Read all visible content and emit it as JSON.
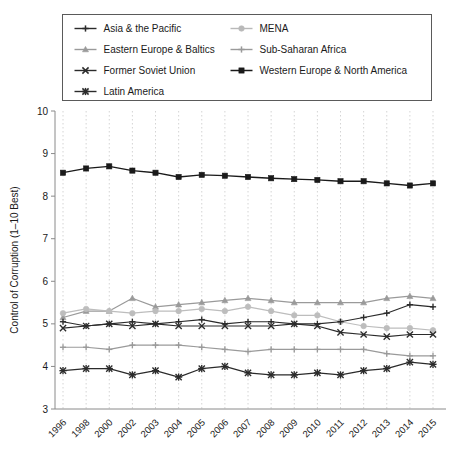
{
  "axis": {
    "ylabel": "Control of Corruption (1–10 Best)",
    "yticks": [
      "3",
      "4",
      "5",
      "6",
      "7",
      "8",
      "9",
      "10"
    ],
    "xlabel": ""
  },
  "legend": {
    "position": "top",
    "entries": [
      {
        "label": "Asia & the Pacific",
        "marker": "plus",
        "color": "#2b2b2b"
      },
      {
        "label": "MENA",
        "marker": "circle",
        "color": "#b9b9b9"
      },
      {
        "label": "Eastern Europe & Baltics",
        "marker": "triangle",
        "color": "#9a9a9a"
      },
      {
        "label": "Sub-Saharan Africa",
        "marker": "plus",
        "color": "#9a9a9a"
      },
      {
        "label": "Former Soviet Union",
        "marker": "x",
        "color": "#2b2b2b"
      },
      {
        "label": "Western Europe & North America",
        "marker": "square",
        "color": "#1a1a1a"
      },
      {
        "label": "Latin America",
        "marker": "star",
        "color": "#2b2b2b"
      }
    ]
  },
  "chart_data": {
    "type": "line",
    "title": "",
    "xlabel": "",
    "ylabel": "Control of Corruption (1–10 Best)",
    "ylim": [
      3,
      10
    ],
    "grid": true,
    "legend_position": "top",
    "categories": [
      "1996",
      "1998",
      "2000",
      "2002",
      "2003",
      "2004",
      "2005",
      "2006",
      "2007",
      "2008",
      "2009",
      "2010",
      "2011",
      "2012",
      "2013",
      "2014",
      "2015"
    ],
    "series": [
      {
        "name": "Western Europe & North America",
        "marker": "square",
        "color": "#1a1a1a",
        "values": [
          8.55,
          8.65,
          8.7,
          8.6,
          8.55,
          8.45,
          8.5,
          8.48,
          8.45,
          8.42,
          8.4,
          8.38,
          8.35,
          8.35,
          8.3,
          8.25,
          8.3
        ]
      },
      {
        "name": "Eastern Europe & Baltics",
        "marker": "triangle",
        "color": "#9a9a9a",
        "values": [
          5.15,
          5.3,
          5.3,
          5.6,
          5.4,
          5.45,
          5.5,
          5.55,
          5.6,
          5.55,
          5.5,
          5.5,
          5.5,
          5.5,
          5.6,
          5.65,
          5.6
        ]
      },
      {
        "name": "MENA",
        "marker": "circle",
        "color": "#bdbdbd",
        "values": [
          5.25,
          5.35,
          5.3,
          5.25,
          5.3,
          5.3,
          5.35,
          5.3,
          5.4,
          5.3,
          5.2,
          5.2,
          5.05,
          4.95,
          4.9,
          4.9,
          4.85
        ]
      },
      {
        "name": "Asia & the Pacific",
        "marker": "plus",
        "color": "#2b2b2b",
        "values": [
          5.05,
          4.95,
          5.0,
          5.05,
          5.0,
          5.05,
          5.1,
          5.0,
          5.05,
          5.05,
          5.0,
          5.0,
          5.05,
          5.15,
          5.25,
          5.45,
          5.4
        ]
      },
      {
        "name": "Former Soviet Union",
        "marker": "x",
        "color": "#2b2b2b",
        "values": [
          4.9,
          4.95,
          5.0,
          4.95,
          5.0,
          4.95,
          4.95,
          4.95,
          4.95,
          4.95,
          5.0,
          4.95,
          4.8,
          4.75,
          4.7,
          4.75,
          4.75
        ]
      },
      {
        "name": "Sub-Saharan Africa",
        "marker": "plus",
        "color": "#9a9a9a",
        "values": [
          4.45,
          4.45,
          4.4,
          4.5,
          4.5,
          4.5,
          4.45,
          4.4,
          4.35,
          4.4,
          4.4,
          4.4,
          4.4,
          4.4,
          4.3,
          4.25,
          4.25
        ]
      },
      {
        "name": "Latin America",
        "marker": "star",
        "color": "#2b2b2b",
        "values": [
          3.9,
          3.95,
          3.95,
          3.8,
          3.9,
          3.75,
          3.95,
          4.0,
          3.85,
          3.8,
          3.8,
          3.85,
          3.8,
          3.9,
          3.95,
          4.1,
          4.05
        ]
      }
    ]
  }
}
